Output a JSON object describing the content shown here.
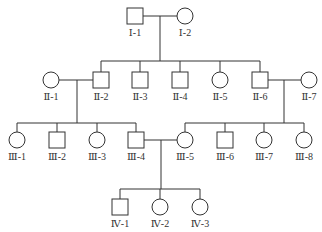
{
  "diagram": {
    "type": "pedigree",
    "colors": {
      "stroke": "#333333",
      "background": "#ffffff"
    },
    "individuals": [
      {
        "id": "I-1",
        "label": "Ⅰ-1",
        "sex": "male",
        "x": 135,
        "y": 16
      },
      {
        "id": "I-2",
        "label": "Ⅰ-2",
        "sex": "female",
        "x": 185,
        "y": 16
      },
      {
        "id": "II-1",
        "label": "Ⅱ-1",
        "sex": "female",
        "x": 51,
        "y": 80
      },
      {
        "id": "II-2",
        "label": "Ⅱ-2",
        "sex": "male",
        "x": 101,
        "y": 80
      },
      {
        "id": "II-3",
        "label": "Ⅱ-3",
        "sex": "male",
        "x": 140,
        "y": 80
      },
      {
        "id": "II-4",
        "label": "Ⅱ-4",
        "sex": "male",
        "x": 180,
        "y": 80
      },
      {
        "id": "II-5",
        "label": "Ⅱ-5",
        "sex": "female",
        "x": 220,
        "y": 80
      },
      {
        "id": "II-6",
        "label": "Ⅱ-6",
        "sex": "male",
        "x": 260,
        "y": 80
      },
      {
        "id": "II-7",
        "label": "Ⅱ-7",
        "sex": "female",
        "x": 309,
        "y": 80
      },
      {
        "id": "III-1",
        "label": "Ⅲ-1",
        "sex": "female",
        "x": 17,
        "y": 140
      },
      {
        "id": "III-2",
        "label": "Ⅲ-2",
        "sex": "male",
        "x": 57,
        "y": 140
      },
      {
        "id": "III-3",
        "label": "Ⅲ-3",
        "sex": "female",
        "x": 97,
        "y": 140
      },
      {
        "id": "III-4",
        "label": "Ⅲ-4",
        "sex": "male",
        "x": 136,
        "y": 140
      },
      {
        "id": "III-5",
        "label": "Ⅲ-5",
        "sex": "female",
        "x": 185,
        "y": 140
      },
      {
        "id": "III-6",
        "label": "Ⅲ-6",
        "sex": "male",
        "x": 225,
        "y": 140
      },
      {
        "id": "III-7",
        "label": "Ⅲ-7",
        "sex": "female",
        "x": 264,
        "y": 140
      },
      {
        "id": "III-8",
        "label": "Ⅲ-8",
        "sex": "female",
        "x": 304,
        "y": 140
      },
      {
        "id": "IV-1",
        "label": "Ⅳ-1",
        "sex": "male",
        "x": 120,
        "y": 207
      },
      {
        "id": "IV-2",
        "label": "Ⅳ-2",
        "sex": "female",
        "x": 160,
        "y": 207
      },
      {
        "id": "IV-3",
        "label": "Ⅳ-3",
        "sex": "female",
        "x": 200,
        "y": 207
      }
    ],
    "marriages": [
      {
        "partners": [
          "I-1",
          "I-2"
        ],
        "drop_x": 160,
        "sibling_bar_y": 61,
        "children": [
          "II-2",
          "II-3",
          "II-4",
          "II-5",
          "II-6"
        ]
      },
      {
        "partners": [
          "II-1",
          "II-2"
        ],
        "drop_x": 77,
        "sibling_bar_y": 123,
        "children": [
          "III-1",
          "III-2",
          "III-3",
          "III-4"
        ]
      },
      {
        "partners": [
          "II-6",
          "II-7"
        ],
        "drop_x": 284,
        "sibling_bar_y": 123,
        "children": [
          "III-5",
          "III-6",
          "III-7",
          "III-8"
        ]
      },
      {
        "partners": [
          "III-4",
          "III-5"
        ],
        "drop_x": 161,
        "sibling_bar_y": 189,
        "children": [
          "IV-1",
          "IV-2",
          "IV-3"
        ]
      }
    ]
  }
}
